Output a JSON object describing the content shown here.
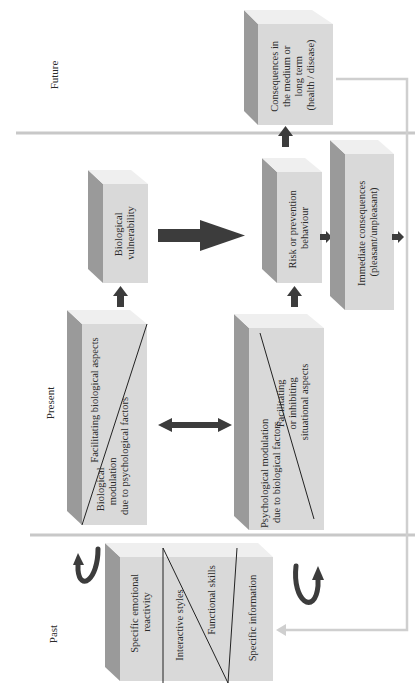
{
  "eras": {
    "future": "Future",
    "present": "Present",
    "past": "Past"
  },
  "boxes": {
    "consequences_long": [
      "Consequences in",
      "the medium or",
      "long term",
      "(health / disease)"
    ],
    "biological_vulnerability": [
      "Biological",
      "vulnerability"
    ],
    "risk_behaviour": [
      "Risk or prevention",
      "behaviour"
    ],
    "immediate_consequences": [
      "Immediate consequences",
      "(pleasant/unpleasant)"
    ],
    "biological_box": {
      "upper": [
        "Facilitating biological aspects"
      ],
      "lower": [
        "Biological",
        "modulation",
        "due to psychological factors"
      ]
    },
    "psychological_box": {
      "upper": [
        "Facilitating",
        "or inhibiting",
        "situational aspects"
      ],
      "lower": [
        "Psychological modulation",
        "due to biological factors"
      ]
    },
    "past_box": {
      "sections": [
        [
          "Specific emotional",
          "reactivity"
        ],
        [
          "Interactive styles"
        ],
        [
          "Functional skills"
        ],
        [
          "Specific information"
        ]
      ]
    }
  },
  "colors": {
    "box_face": "#d9d9d9",
    "box_side": "#9a9a9a",
    "arrow": "#3c3c3c",
    "divider": "#c8c8c8"
  }
}
